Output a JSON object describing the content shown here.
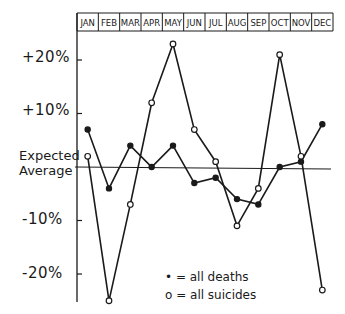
{
  "chart_data": {
    "type": "line",
    "title": "",
    "xlabel": "",
    "ylabel": "",
    "categories": [
      "JAN",
      "FEB",
      "MAR",
      "APR",
      "MAY",
      "JUN",
      "JUL",
      "AUG",
      "SEP",
      "OCT",
      "NOV",
      "DEC"
    ],
    "series": [
      {
        "name": "all deaths",
        "marker": "filled-circle",
        "values": [
          7,
          -4,
          4,
          0,
          4,
          -3,
          -2,
          -6,
          -7,
          0,
          1,
          8
        ]
      },
      {
        "name": "all suicides",
        "marker": "open-circle",
        "values": [
          2,
          -25,
          -7,
          12,
          23,
          7,
          1,
          -11,
          -4,
          21,
          2,
          -23
        ]
      }
    ],
    "y_ticks": [
      {
        "value": 20,
        "label": "+20%"
      },
      {
        "value": 10,
        "label": "+10%"
      },
      {
        "value": -10,
        "label": "-10%"
      },
      {
        "value": -20,
        "label": "-20%"
      }
    ],
    "reference_line": {
      "value": 0,
      "label_line1": "Expected",
      "label_line2": "Average"
    },
    "ylim": [
      -25,
      25
    ],
    "grid": false,
    "legend_position": "lower-center-inside"
  },
  "legend": {
    "deaths": "• = all deaths",
    "suicides": "o = all suicides"
  },
  "y_labels": {
    "p20": "+20%",
    "p10": "+10%",
    "m10": "-10%",
    "m20": "-20%",
    "expected_1": "Expected",
    "expected_2": "Average"
  }
}
